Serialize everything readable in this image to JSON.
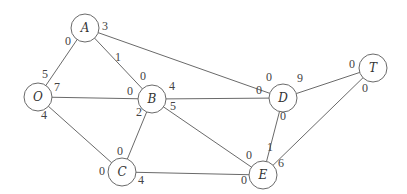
{
  "diagram": {
    "type": "network-flow-graph",
    "nodes": [
      {
        "id": "A",
        "label": "A",
        "x": 85,
        "y": 28
      },
      {
        "id": "O",
        "label": "O",
        "x": 38,
        "y": 97
      },
      {
        "id": "B",
        "label": "B",
        "x": 152,
        "y": 99
      },
      {
        "id": "D",
        "label": "D",
        "x": 283,
        "y": 98
      },
      {
        "id": "T",
        "label": "T",
        "x": 373,
        "y": 68
      },
      {
        "id": "C",
        "label": "C",
        "x": 122,
        "y": 172
      },
      {
        "id": "E",
        "label": "E",
        "x": 263,
        "y": 175
      }
    ],
    "edges": [
      {
        "from": "O",
        "to": "A",
        "from_label": "5",
        "to_label": "0"
      },
      {
        "from": "O",
        "to": "B",
        "from_label": "7",
        "to_label": "0"
      },
      {
        "from": "O",
        "to": "C",
        "from_label": "4",
        "to_label": "0"
      },
      {
        "from": "A",
        "to": "B",
        "from_label": "1",
        "to_label": "0"
      },
      {
        "from": "A",
        "to": "D",
        "from_label": "3",
        "to_label": "0"
      },
      {
        "from": "B",
        "to": "C",
        "from_label": "2",
        "to_label": "0"
      },
      {
        "from": "B",
        "to": "D",
        "from_label": "4",
        "to_label": "0"
      },
      {
        "from": "B",
        "to": "E",
        "from_label": "5",
        "to_label": "0"
      },
      {
        "from": "C",
        "to": "E",
        "from_label": "4",
        "to_label": "0"
      },
      {
        "from": "D",
        "to": "T",
        "from_label": "9",
        "to_label": "0"
      },
      {
        "from": "D",
        "to": "E",
        "from_label": "0",
        "to_label": "1"
      },
      {
        "from": "E",
        "to": "T",
        "from_label": "6",
        "to_label": "0"
      }
    ],
    "label_positions": [
      {
        "text": "0",
        "x": 68,
        "y": 41
      },
      {
        "text": "5",
        "x": 45,
        "y": 74
      },
      {
        "text": "3",
        "x": 105,
        "y": 26
      },
      {
        "text": "1",
        "x": 118,
        "y": 57
      },
      {
        "text": "0",
        "x": 143,
        "y": 76
      },
      {
        "text": "7",
        "x": 57,
        "y": 87
      },
      {
        "text": "0",
        "x": 130,
        "y": 91
      },
      {
        "text": "4",
        "x": 44,
        "y": 115
      },
      {
        "text": "4",
        "x": 172,
        "y": 86
      },
      {
        "text": "5",
        "x": 173,
        "y": 106
      },
      {
        "text": "2",
        "x": 139,
        "y": 112
      },
      {
        "text": "0",
        "x": 269,
        "y": 77
      },
      {
        "text": "0",
        "x": 259,
        "y": 90
      },
      {
        "text": "9",
        "x": 300,
        "y": 78
      },
      {
        "text": "0",
        "x": 352,
        "y": 64
      },
      {
        "text": "0",
        "x": 365,
        "y": 88
      },
      {
        "text": "0",
        "x": 283,
        "y": 116
      },
      {
        "text": "0",
        "x": 120,
        "y": 151
      },
      {
        "text": "0",
        "x": 102,
        "y": 171
      },
      {
        "text": "4",
        "x": 141,
        "y": 180
      },
      {
        "text": "0",
        "x": 249,
        "y": 155
      },
      {
        "text": "1",
        "x": 270,
        "y": 147
      },
      {
        "text": "6",
        "x": 281,
        "y": 163
      },
      {
        "text": "0",
        "x": 244,
        "y": 180
      }
    ],
    "node_radius": 14,
    "colors": {
      "stroke": "#6a6a6a",
      "text": "#333333",
      "background": "#ffffff"
    }
  }
}
